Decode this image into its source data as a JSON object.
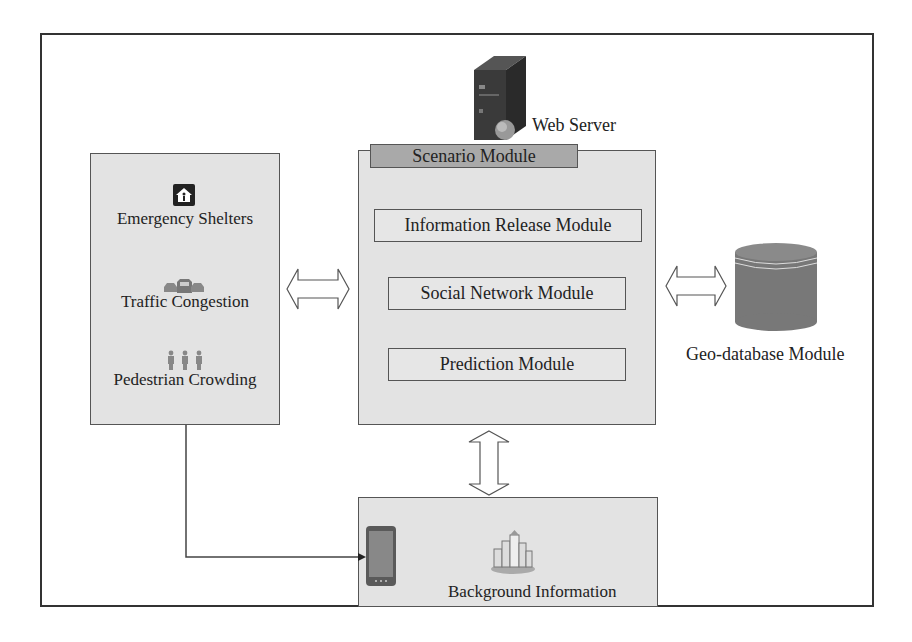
{
  "diagram": {
    "web_server": {
      "label": "Web Server",
      "icon": "server-tower-with-globe"
    },
    "left_panel": {
      "items": [
        {
          "label": "Emergency Shelters",
          "icon": "shelter-house-icon"
        },
        {
          "label": "Traffic Congestion",
          "icon": "cars-icon"
        },
        {
          "label": "Pedestrian Crowding",
          "icon": "pedestrians-icon"
        }
      ]
    },
    "scenario_module": {
      "title": "Scenario Module",
      "submodules": [
        {
          "label": "Information Release Module"
        },
        {
          "label": "Social Network Module"
        },
        {
          "label": "Prediction Module"
        }
      ]
    },
    "geo_database": {
      "label": "Geo-database Module",
      "icon": "database-cylinder"
    },
    "background_info": {
      "label": "Background Information",
      "icons": [
        "smartphone-icon",
        "city-buildings-icon"
      ]
    },
    "connections": [
      {
        "from": "left_panel",
        "to": "scenario_module",
        "type": "double-arrow"
      },
      {
        "from": "scenario_module",
        "to": "geo_database",
        "type": "double-arrow"
      },
      {
        "from": "scenario_module",
        "to": "background_info",
        "type": "double-arrow"
      },
      {
        "from": "left_panel",
        "to": "background_info.smartphone",
        "type": "arrow"
      }
    ],
    "colors": {
      "panel_fill": "#e3e3e3",
      "tab_fill": "#a9a9a9",
      "database_fill": "#7a7a7a",
      "border": "#555555"
    }
  }
}
